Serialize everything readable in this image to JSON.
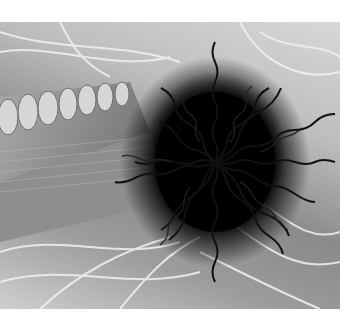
{
  "image": {
    "description": "Grayscale scanning electron micrograph showing a dense dark mass of wavy filaments radiating over a segmented structure with pale fibers",
    "colors": {
      "background": "#ffffff",
      "core": "#000000",
      "filament": "#1a1a1a",
      "fiber_light": "#f0f0f0",
      "segment": "#c8c8c8"
    },
    "bounds": {
      "left": 0,
      "top": 22,
      "width": 340,
      "height": 287
    }
  }
}
